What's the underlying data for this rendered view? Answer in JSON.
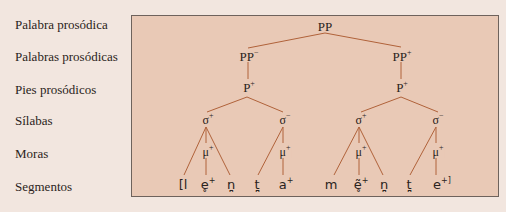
{
  "row_labels": [
    "Palabra prosódica",
    "Palabras prosódicas",
    "Pies prosódicos",
    "Sílabas",
    "Moras",
    "Segmentos"
  ],
  "tree": {
    "pp": {
      "base": "PP",
      "sup": ""
    },
    "pp_left": {
      "base": "PP",
      "sup": "−"
    },
    "pp_right": {
      "base": "PP",
      "sup": "+"
    },
    "foot_left": {
      "base": "P",
      "sup": "+"
    },
    "foot_right": {
      "base": "P",
      "sup": "+"
    },
    "syllables": [
      {
        "base": "σ",
        "sup": "+"
      },
      {
        "base": "σ",
        "sup": "−"
      },
      {
        "base": "σ",
        "sup": "+"
      },
      {
        "base": "σ",
        "sup": "−"
      }
    ],
    "moras": [
      {
        "base": "μ",
        "sup": "+"
      },
      {
        "base": "μ",
        "sup": "+"
      },
      {
        "base": "μ",
        "sup": "+"
      },
      {
        "base": "μ",
        "sup": "+"
      }
    ],
    "segments": [
      {
        "base": "[l",
        "sup": ""
      },
      {
        "base": "e̥",
        "sup": "+"
      },
      {
        "base": "n̪",
        "sup": ""
      },
      {
        "base": "t̪",
        "sup": ""
      },
      {
        "base": "a",
        "sup": "+"
      },
      {
        "base": "m",
        "sup": ""
      },
      {
        "base": "ẽ̥",
        "sup": "+"
      },
      {
        "base": "n̪",
        "sup": ""
      },
      {
        "base": "t̪",
        "sup": ""
      },
      {
        "base": "e",
        "sup": "+]"
      }
    ]
  },
  "colors": {
    "page_bg": "#f2e6df",
    "box_bg": "#e9c9b6",
    "line": "#b0623a",
    "border": "#6e625c"
  }
}
